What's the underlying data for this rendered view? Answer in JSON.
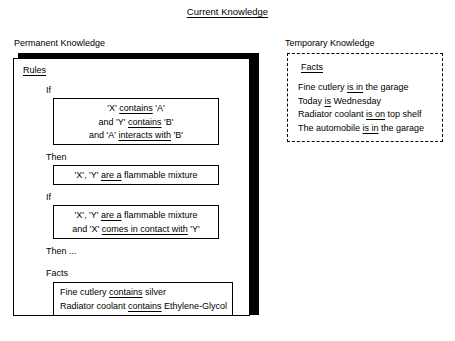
{
  "title": "Current Knowledge",
  "permanent": {
    "caption": "Permanent Knowledge",
    "heading": "Rules",
    "if_label_1": "If",
    "then_label_1": "Then",
    "if_label_2": "If",
    "then_label_2": "Then ...",
    "facts_label": "Facts",
    "rule1_if": {
      "line1_a": "'X' ",
      "line1_u": "contains",
      "line1_b": " 'A'",
      "line2_a": "and 'Y' ",
      "line2_u": "contains",
      "line2_b": " 'B'",
      "line3_a": "and 'A' ",
      "line3_u": "interacts with",
      "line3_b": " 'B'"
    },
    "rule1_then": {
      "line1_a": "'X', 'Y' ",
      "line1_u": "are a",
      "line1_b": " flammable mixture"
    },
    "rule2_if": {
      "line1_a": "'X', 'Y' ",
      "line1_u": "are a",
      "line1_b": " flammable mixture",
      "line2_a": "and 'X' ",
      "line2_u": "comes in contact with",
      "line2_b": " 'Y'"
    },
    "facts": {
      "line1_a": "Fine cutlery ",
      "line1_u": "contains",
      "line1_b": " silver",
      "line2_a": "Radiator coolant ",
      "line2_u": "contains",
      "line2_b": " Ethylene-Glycol"
    }
  },
  "temporary": {
    "caption": "Temporary Knowledge",
    "heading": "Facts",
    "facts": {
      "line1_a": "Fine cutlery ",
      "line1_u": "is in",
      "line1_b": " the garage",
      "line2_a": "Today ",
      "line2_u": "is",
      "line2_b": " Wednesday",
      "line3_a": "Radiator coolant ",
      "line3_u": "is on",
      "line3_b": " top shelf",
      "line4_a": "The automobile ",
      "line4_u": "is in",
      "line4_b": " the garage"
    }
  },
  "colors": {
    "ink": "#000000",
    "paper": "#ffffff"
  }
}
